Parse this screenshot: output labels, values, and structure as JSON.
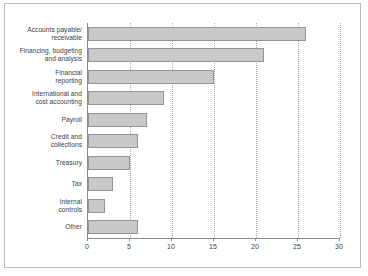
{
  "chart_data": {
    "type": "bar",
    "orientation": "horizontal",
    "title": "",
    "xlabel": "",
    "ylabel": "",
    "xlim": [
      0,
      30
    ],
    "xticks": [
      0,
      5,
      10,
      15,
      20,
      25,
      30
    ],
    "xtick_labels": [
      "0",
      "5",
      "10",
      "15",
      "20",
      "25",
      "30"
    ],
    "grid": "vertical-dotted",
    "legend": "none",
    "categories": [
      "Accounts payable/\nreceivable",
      "Financing, budgeting\nand analysis",
      "Financial\nreporting",
      "International and\ncost accounting",
      "Payroll",
      "Credit and\ncollections",
      "Treasury",
      "Tax",
      "Internal\ncontrols",
      "Other"
    ],
    "values": [
      26,
      21,
      15,
      9,
      7,
      6,
      5,
      3,
      2,
      6
    ],
    "colors": {
      "bar_fill": "#c9c9c9",
      "bar_border": "#949494",
      "gridline": "#a8a8a8",
      "axis": "#8a8a8a",
      "frame": "#b9b9b9",
      "text": "#3c3c3c",
      "background": "#ffffff"
    }
  }
}
